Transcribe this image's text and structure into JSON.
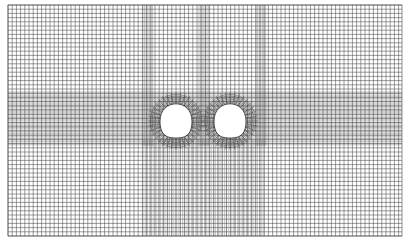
{
  "diagram": {
    "type": "finite-element mesh",
    "domain_bounds": {
      "x0": 8,
      "y0": 5,
      "x1": 402,
      "y1": 236
    },
    "coarse_spacing": 4.2,
    "dense_spacing": 1.6,
    "line_color": "#3a3a3a",
    "dense_band_color": "#555555",
    "background": "#ffffff",
    "horizontal_dense_band": {
      "y0": 92,
      "y1": 146
    },
    "vertical_dense_bands_top": [
      {
        "x0": 143,
        "x1": 153
      },
      {
        "x0": 199,
        "x1": 209
      },
      {
        "x0": 256,
        "x1": 266
      }
    ],
    "vertical_dense_region_bottom": {
      "x0": 143,
      "x1": 266,
      "y0": 140,
      "y1": 236
    },
    "tunnels": [
      {
        "label": "left-tunnel",
        "cx": 176,
        "cy": 121,
        "rx": 16,
        "ry": 17
      },
      {
        "label": "right-tunnel",
        "cx": 230,
        "cy": 121,
        "rx": 16,
        "ry": 17
      }
    ]
  }
}
